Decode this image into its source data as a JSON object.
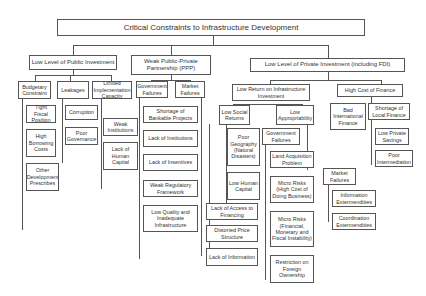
{
  "diagram": {
    "root": "Critical Constraints to Infrastructure Development",
    "public": {
      "title": "Low Level of Public Investment",
      "budgetary": {
        "title": "Budgetary Constraint",
        "items": [
          "Tight Fiscal Position",
          "High Borrowing Costs",
          "Other Development Prescribes"
        ]
      },
      "leakages": {
        "title": "Leakages",
        "items": [
          "Corruption",
          "Poor Governance"
        ]
      },
      "capacity": {
        "title": "Limited Implementation Capacity",
        "items": [
          "Weak Institutions",
          "Lack of Human Capital"
        ]
      }
    },
    "ppp": {
      "title": "Weak Public-Private Partnership (PPP)",
      "government": "Government Failures",
      "market": "Market Failures",
      "items": [
        "Shortage of Bankable Projects",
        "Lack of Institutions",
        "Lack of Insentives",
        "Weak Regulatory Framework",
        "Low Quality and Inadequate Infrastructure"
      ]
    },
    "private": {
      "title": "Low Level of Private Investment (including FDI)",
      "low_return": {
        "title": "Low Return on Infrastructure Investment",
        "social": {
          "title": "Low Social Returns",
          "items": [
            "Poor Geography (Natural Disasters)",
            "Low Human Capital"
          ]
        },
        "social_more": [
          "Lack of Access to Financing",
          "Distorted Price Structure",
          "Lack of Information"
        ],
        "appropriability": {
          "title": "Low Appropriability",
          "government": {
            "title": "Government Failures",
            "items": [
              "Land Acquisition Problem",
              "Micro Risks (High Cost of Doing Business)",
              "Micro Risks (Financial, Monetary and Fiscal Instability)",
              "Restriction on Foreign Ownership"
            ]
          },
          "market": {
            "title": "Market Failures",
            "items": [
              "Information Extermendities",
              "Coordination Extermendities"
            ]
          }
        }
      },
      "finance": {
        "title": "High Cost of Finance",
        "bad": "Bad International Finance",
        "local": {
          "title": "Shortage of Local Finance",
          "items": [
            "Low Private Savings",
            "Poor Intermediation"
          ]
        }
      }
    }
  }
}
